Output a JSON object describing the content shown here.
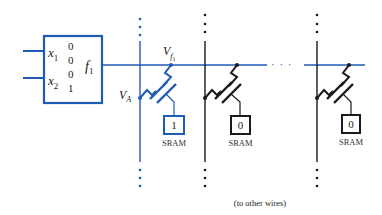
{
  "colors": {
    "blue": "#1f5bb5",
    "black": "#1a1a1a"
  },
  "logic_block": {
    "inputs": [
      {
        "name": "x",
        "sub": "1"
      },
      {
        "name": "x",
        "sub": "2"
      }
    ],
    "truth_values": [
      "0",
      "0",
      "0",
      "1"
    ],
    "output": {
      "name": "f",
      "sub": "1"
    }
  },
  "labels": {
    "vf": {
      "name": "V",
      "sub": "f",
      "subsub": "1"
    },
    "va": {
      "name": "V",
      "sub": "A"
    },
    "ellipsis": "· · ·",
    "to_other_wires": "(to other wires)"
  },
  "switches": [
    {
      "sram_value": "1",
      "sram_label": "SRAM",
      "active": true
    },
    {
      "sram_value": "0",
      "sram_label": "SRAM",
      "active": false
    },
    {
      "sram_value": "0",
      "sram_label": "SRAM",
      "active": false
    }
  ]
}
